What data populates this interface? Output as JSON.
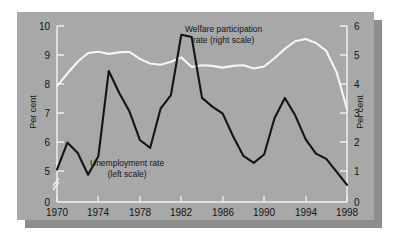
{
  "figure": {
    "background_color": "#a8a8a8",
    "shadow_color": "#8d8d8d",
    "page_color": "#ffffff"
  },
  "axes": {
    "left_title": "Per cent",
    "right_title": "Per cent",
    "left_ticks": [
      "0",
      "5",
      "6",
      "7",
      "8",
      "9",
      "10"
    ],
    "right_ticks": [
      "0",
      "1",
      "2",
      "3",
      "4",
      "5",
      "6"
    ],
    "x_ticks": [
      "1970",
      "1974",
      "1978",
      "1982",
      "1986",
      "1990",
      "1994",
      "1998"
    ],
    "left_axis_break": true,
    "left_break_label": "axis-break-zigzag"
  },
  "annotations": {
    "welfare_line1": "Welfare participation",
    "welfare_line2": "rate (right scale)",
    "unemployment_line1": "Unemployment rate",
    "unemployment_line2": "(left scale)"
  },
  "chart_data": {
    "type": "line",
    "title": "",
    "xlabel": "",
    "ylabel": "Per cent",
    "grid": false,
    "legend": "inline-annotations",
    "x": [
      1970,
      1971,
      1972,
      1973,
      1974,
      1975,
      1976,
      1977,
      1978,
      1979,
      1980,
      1981,
      1982,
      1983,
      1984,
      1985,
      1986,
      1987,
      1988,
      1989,
      1990,
      1991,
      1992,
      1993,
      1994,
      1995,
      1996,
      1997,
      1998
    ],
    "series": [
      {
        "name": "Unemployment rate (left scale)",
        "axis": "left",
        "color": "#141414",
        "ylim": [
          4.6,
          10.0
        ],
        "ylabel": "Per cent",
        "values": [
          5.05,
          5.98,
          5.62,
          4.87,
          5.52,
          8.45,
          7.7,
          7.05,
          6.07,
          5.8,
          7.15,
          7.62,
          9.7,
          9.62,
          7.52,
          7.22,
          6.98,
          6.2,
          5.52,
          5.28,
          5.57,
          6.82,
          7.52,
          6.92,
          6.1,
          5.6,
          5.42,
          4.97,
          4.52
        ]
      },
      {
        "name": "Welfare participation rate (right scale)",
        "axis": "right",
        "color": "#f5f5f5",
        "ylim": [
          0,
          6
        ],
        "ylabel": "Per cent",
        "values": [
          3.95,
          4.38,
          4.78,
          5.08,
          5.12,
          5.05,
          5.1,
          5.12,
          4.88,
          4.72,
          4.68,
          4.78,
          4.93,
          4.6,
          4.66,
          4.64,
          4.58,
          4.64,
          4.66,
          4.55,
          4.62,
          4.9,
          5.22,
          5.48,
          5.56,
          5.42,
          5.15,
          4.42,
          3.16
        ]
      }
    ]
  }
}
